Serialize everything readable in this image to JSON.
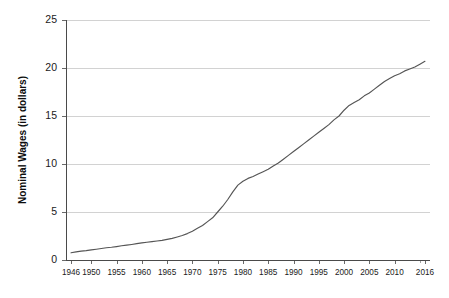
{
  "chart_data": {
    "type": "line",
    "title": "",
    "xlabel": "",
    "ylabel": "Nominal Wages (in dollars)",
    "xlim": [
      1945,
      2017
    ],
    "ylim": [
      0,
      25
    ],
    "grid": true,
    "legend": false,
    "legend_position": "none",
    "y_ticks": [
      0,
      5,
      10,
      15,
      20,
      25
    ],
    "y_tick_labels": [
      "0",
      "5",
      "10",
      "15",
      "20",
      "25"
    ],
    "x_tick_labels": [
      "1946",
      "1950",
      "1955",
      "1960",
      "1965",
      "1970",
      "1975",
      "1980",
      "1985",
      "1990",
      "1995",
      "2000",
      "2005",
      "2010",
      "2016"
    ],
    "x_tick_values": [
      1946,
      1950,
      1955,
      1960,
      1965,
      1970,
      1975,
      1980,
      1985,
      1990,
      1995,
      2000,
      2005,
      2010,
      2016
    ],
    "series": [
      {
        "name": "Nominal Wages",
        "color": "#555555",
        "x": [
          1946,
          1947,
          1948,
          1949,
          1950,
          1951,
          1952,
          1953,
          1954,
          1955,
          1956,
          1957,
          1958,
          1959,
          1960,
          1961,
          1962,
          1963,
          1964,
          1965,
          1966,
          1967,
          1968,
          1969,
          1970,
          1971,
          1972,
          1973,
          1974,
          1975,
          1976,
          1977,
          1978,
          1979,
          1980,
          1981,
          1982,
          1983,
          1984,
          1985,
          1986,
          1987,
          1988,
          1989,
          1990,
          1991,
          1992,
          1993,
          1994,
          1995,
          1996,
          1997,
          1998,
          1999,
          2000,
          2001,
          2002,
          2003,
          2004,
          2005,
          2006,
          2007,
          2008,
          2009,
          2010,
          2011,
          2012,
          2013,
          2014,
          2015,
          2016
        ],
        "values": [
          0.75,
          0.85,
          0.93,
          0.98,
          1.05,
          1.12,
          1.2,
          1.28,
          1.33,
          1.4,
          1.48,
          1.55,
          1.62,
          1.7,
          1.78,
          1.85,
          1.92,
          1.98,
          2.05,
          2.15,
          2.25,
          2.4,
          2.55,
          2.75,
          3.0,
          3.3,
          3.6,
          4.0,
          4.4,
          5.0,
          5.6,
          6.3,
          7.1,
          7.8,
          8.2,
          8.5,
          8.7,
          8.95,
          9.2,
          9.45,
          9.8,
          10.1,
          10.5,
          10.9,
          11.3,
          11.7,
          12.1,
          12.5,
          12.9,
          13.3,
          13.7,
          14.1,
          14.6,
          15.0,
          15.6,
          16.1,
          16.4,
          16.7,
          17.1,
          17.4,
          17.8,
          18.2,
          18.6,
          18.9,
          19.2,
          19.4,
          19.7,
          19.9,
          20.1,
          20.4,
          20.7
        ]
      }
    ]
  },
  "plot": {
    "area_left": 66,
    "area_right": 430,
    "area_top": 20,
    "area_bottom": 260,
    "gridline_color": "#d2d2d2",
    "axis_color": "#4a4a4a",
    "line_color": "#555555",
    "background": "#ffffff"
  }
}
